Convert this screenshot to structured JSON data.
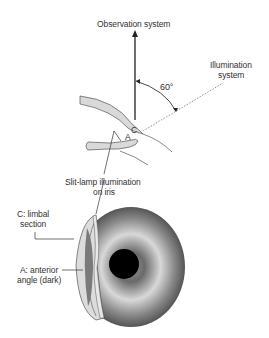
{
  "diagram": {
    "labels": {
      "observation": "Observation system",
      "illumination_line1": "Illumination",
      "illumination_line2": "system",
      "angle": "60°",
      "point_a": "A",
      "point_c": "C",
      "slitlamp_line1": "Slit-lamp illumination",
      "slitlamp_line2": "on iris",
      "limbal_line1": "C: limbal",
      "limbal_line2": "section",
      "anterior_line1": "A: anterior",
      "anterior_line2": "angle (dark)"
    },
    "colors": {
      "line": "#333333",
      "cornea_fill": "#d9d9d9",
      "iris_light": "#e6e6e6",
      "iris_dark": "#5a5a5a",
      "pupil": "#000000"
    }
  }
}
